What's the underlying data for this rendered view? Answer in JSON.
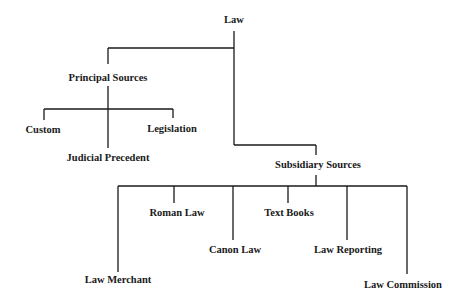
{
  "diagram": {
    "type": "tree",
    "root": {
      "label": "Law",
      "children": [
        {
          "label": "Principal Sources",
          "children": [
            {
              "label": "Custom"
            },
            {
              "label": "Judicial Precedent"
            },
            {
              "label": "Legislation"
            }
          ]
        },
        {
          "label": "Subsidiary Sources",
          "children": [
            {
              "label": "Law Merchant"
            },
            {
              "label": "Roman Law"
            },
            {
              "label": "Canon Law"
            },
            {
              "label": "Text Books"
            },
            {
              "label": "Law Reporting"
            },
            {
              "label": "Law Commission"
            }
          ]
        }
      ]
    }
  },
  "nodes": {
    "law": "Law",
    "principal": "Principal Sources",
    "custom": "Custom",
    "judicial": "Judicial Precedent",
    "legislation": "Legislation",
    "subsidiary": "Subsidiary Sources",
    "law_merchant": "Law Merchant",
    "roman_law": "Roman Law",
    "canon_law": "Canon Law",
    "text_books": "Text Books",
    "law_reporting": "Law Reporting",
    "law_commission": "Law Commission"
  },
  "colors": {
    "line": "#1a1a1a",
    "text": "#1a1a1a",
    "background": "#ffffff"
  }
}
